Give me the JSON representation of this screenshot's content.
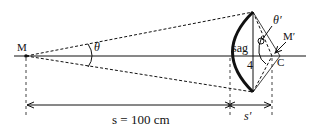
{
  "diagram": {
    "labels": {
      "object_point": "M",
      "image_point": "M′",
      "center": "C",
      "angle_object": "θ",
      "angle_image": "θ′",
      "sag": "sag",
      "half_height": "4",
      "object_distance": "s = 100 cm",
      "image_distance": "s′"
    },
    "colors": {
      "ink": "#111111",
      "background": "#ffffff"
    }
  }
}
